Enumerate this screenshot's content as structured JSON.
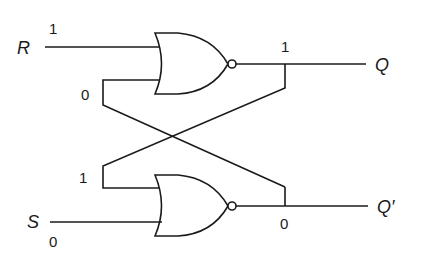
{
  "diagram": {
    "type": "SR latch (cross-coupled NOR gates)",
    "inputs": {
      "r": {
        "label": "R",
        "value": "1"
      },
      "s": {
        "label": "S",
        "value": "0"
      }
    },
    "outputs": {
      "q": {
        "label": "Q",
        "value": "1"
      },
      "q_bar": {
        "label": "Q′",
        "value": "0"
      }
    },
    "feedback": {
      "top_gate_second_input_value": "0",
      "bottom_gate_first_input_value": "1"
    },
    "gates": [
      {
        "id": "nor-top",
        "kind": "NOR"
      },
      {
        "id": "nor-bottom",
        "kind": "NOR"
      }
    ],
    "colors": {
      "ink": "#1a1a1a",
      "background": "#ffffff"
    }
  }
}
